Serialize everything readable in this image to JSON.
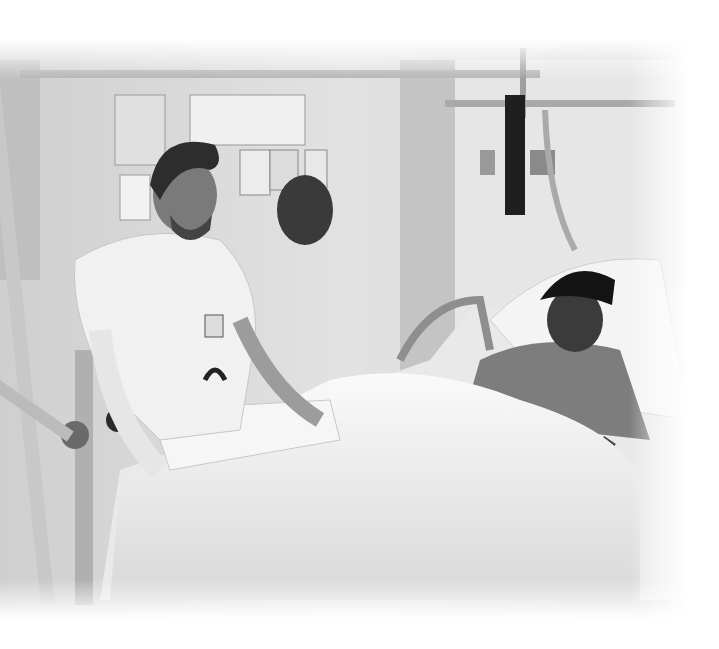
{
  "image": {
    "description": "Black-and-white photograph of a male nurse in a white uniform examining the casted leg of a young patient wearing a dark cap, lying in a hospital bed under a white blanket, with an overhead traction frame and drawings pinned on the wall behind.",
    "style": "grayscale photo with soft white vignette edges",
    "colors": {
      "background": "#ffffff",
      "wall": "#d9d9d9",
      "wall_shadow": "#a8a8a8",
      "blanket": "#f2f2f2",
      "metal": "#bdbdbd",
      "dark": "#1e1e1e"
    }
  }
}
